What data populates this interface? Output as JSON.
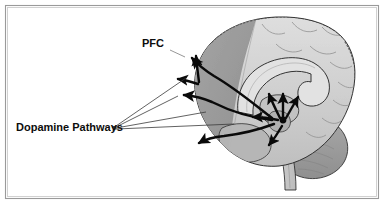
{
  "figure": {
    "title": "Dopamine Pathways",
    "background_color": "#ffffff",
    "frame": {
      "name": "border-frame",
      "outer_color": "#9a9a9a",
      "inner_color": "#c8c8c8",
      "inset_px": 5
    }
  },
  "labels": {
    "pfc": {
      "text": "PFC",
      "font_size_px": 11,
      "bold": true,
      "color": "#0d0d0d",
      "x": 142,
      "y": 47
    },
    "dopamine_pathways": {
      "text": "Dopamine Pathways",
      "font_size_px": 11,
      "bold": true,
      "color": "#0d0d0d",
      "x": 16,
      "y": 131
    }
  },
  "anatomy": {
    "regions": [
      {
        "name": "prefrontal-cortex",
        "label": "Prefrontal cortex (PFC)",
        "shade": "#9b9b9b",
        "shaded_darker": true
      },
      {
        "name": "cerebral-cortex",
        "label": "Cerebral cortex",
        "shade": "#cfcfcf"
      },
      {
        "name": "corpus-callosum",
        "label": "Corpus callosum",
        "shade": "#dcdcdc"
      },
      {
        "name": "thalamus",
        "label": "Thalamus / diencephalon",
        "shade": "#c4c4c4"
      },
      {
        "name": "brainstem",
        "label": "Brainstem",
        "shade": "#c9c9c9"
      },
      {
        "name": "cerebellum",
        "label": "Cerebellum",
        "shade": "#9e9e9e"
      },
      {
        "name": "temporal-lobe",
        "label": "Temporal lobe",
        "shade": "#b4b4b4"
      }
    ],
    "outline_color": "#2b2b2b"
  },
  "pathways": {
    "color": "#0a0a0a",
    "origin_label": "VTA / midbrain",
    "origin": {
      "x": 283,
      "y": 120
    },
    "arrow_count": 9,
    "description": "Black arrows radiating from the midbrain to the prefrontal cortex, limbic and striatal targets"
  },
  "leader_lines": {
    "color": "#3a3a3a",
    "from": {
      "x": 114,
      "y": 127
    },
    "targets": [
      {
        "x": 178,
        "y": 96
      },
      {
        "x": 186,
        "y": 78
      },
      {
        "x": 205,
        "y": 110
      },
      {
        "x": 232,
        "y": 122
      }
    ]
  },
  "pfc_leader": {
    "color": "#3a3a3a",
    "from": {
      "x": 170,
      "y": 50
    },
    "to": {
      "x": 186,
      "y": 58
    }
  }
}
